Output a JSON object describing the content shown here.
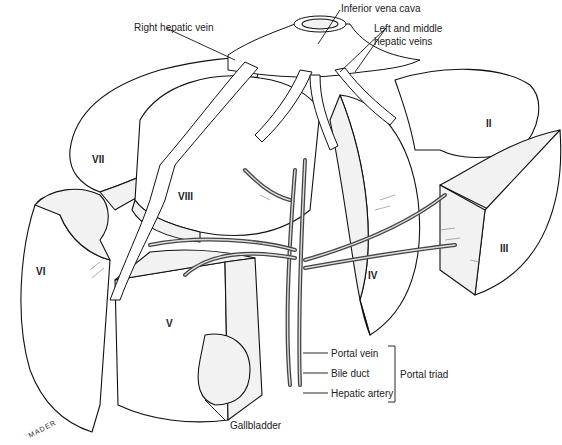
{
  "figure": {
    "type": "anatomical-illustration",
    "signature": "MADER"
  },
  "labels": {
    "right_hepatic_vein": "Right hepatic vein",
    "inferior_vena_cava": "Inferior vena cava",
    "left_middle_hepatic_veins_1": "Left and middle",
    "left_middle_hepatic_veins_2": "hepatic veins",
    "portal_vein": "Portal vein",
    "bile_duct": "Bile duct",
    "hepatic_artery": "Hepatic artery",
    "portal_triad": "Portal triad",
    "gallbladder": "Gallbladder"
  },
  "segments": {
    "II": "II",
    "III": "III",
    "IV": "IV",
    "V": "V",
    "VI": "VI",
    "VII": "VII",
    "VIII": "VIII"
  }
}
